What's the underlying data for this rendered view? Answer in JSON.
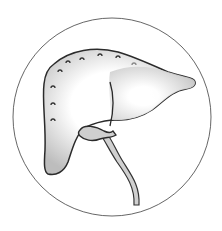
{
  "illustration": {
    "subject": "liver with gallbladder and bile duct",
    "frame": "circle",
    "colors": {
      "background": "#ffffff",
      "outline": "#2b2b2b",
      "circle": "#555555",
      "shade": "#bdbdbd",
      "fill": "#ffffff"
    }
  }
}
